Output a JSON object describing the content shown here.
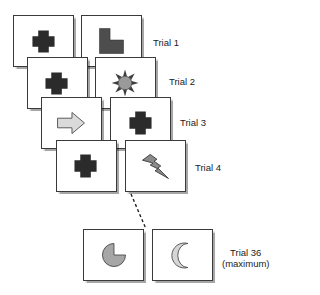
{
  "colors": {
    "cross": "#2b2b2b",
    "l_shape": "#4d4d4d",
    "sun_core": "#9a9a9a",
    "sun_rays": "#3d3d3d",
    "arrow": "#dadada",
    "lightning": "#8a8a8a",
    "pacman": "#a6a6a6",
    "crescent": "#d6d6d6",
    "outline": "#3a3a3a"
  },
  "trials": [
    {
      "label": "Trial 1",
      "left_card": {
        "shape": "cross-icon"
      },
      "right_card": {
        "shape": "l-shape-icon"
      }
    },
    {
      "label": "Trial 2",
      "left_card": {
        "shape": "cross-icon"
      },
      "right_card": {
        "shape": "sun-icon"
      }
    },
    {
      "label": "Trial 3",
      "left_card": {
        "shape": "arrow-right-icon"
      },
      "right_card": {
        "shape": "cross-icon"
      }
    },
    {
      "label": "Trial 4",
      "left_card": {
        "shape": "cross-icon"
      },
      "right_card": {
        "shape": "lightning-icon"
      }
    },
    {
      "label": "Trial 36",
      "sublabel": "(maximum)",
      "left_card": {
        "shape": "pacman-icon"
      },
      "right_card": {
        "shape": "crescent-icon"
      }
    }
  ]
}
